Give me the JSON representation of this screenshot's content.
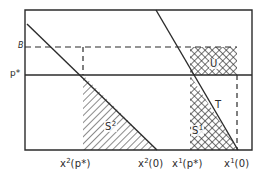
{
  "figure": {
    "type": "economics-diagram",
    "background_color": "#ffffff",
    "line_color": "#2b2b2b",
    "frame": {
      "x": 25,
      "y": 10,
      "width": 227,
      "height": 140
    },
    "axes": {
      "y_labels": [
        {
          "id": "B",
          "text": "B",
          "value_y": 47,
          "style": "italic"
        },
        {
          "id": "p_star",
          "text": "p*",
          "value_y": 75,
          "style": "normal"
        }
      ],
      "x_labels": [
        {
          "id": "x2_pstar",
          "base": "x",
          "sup": "2",
          "arg": "(p*)",
          "tick_x": 83
        },
        {
          "id": "x2_0",
          "base": "x",
          "sup": "2",
          "arg": "(0)",
          "tick_x": 155
        },
        {
          "id": "x1_pstar",
          "base": "x",
          "sup": "1",
          "arg": "(p*)",
          "tick_x": 190
        },
        {
          "id": "x1_0",
          "base": "x",
          "sup": "1",
          "arg": "(0)",
          "tick_x": 237
        }
      ]
    },
    "regions": [
      {
        "id": "S2",
        "base": "S",
        "sup": "2",
        "hatch": "diagonal",
        "label_x": 110,
        "label_y": 126
      },
      {
        "id": "S1",
        "base": "S",
        "sup": "1",
        "hatch": "cross",
        "label_x": 196,
        "label_y": 130
      },
      {
        "id": "T",
        "base": "T",
        "sup": "",
        "hatch": "none",
        "label_x": 218,
        "label_y": 105
      },
      {
        "id": "U",
        "base": "U",
        "sup": "",
        "hatch": "cross",
        "label_x": 212,
        "label_y": 64
      }
    ],
    "lines": {
      "demand_curve_2": {
        "from_x": 27,
        "from_y": 24,
        "to_x": 157,
        "to_y": 150
      },
      "demand_curve_1": {
        "from_x": 156,
        "from_y": 10,
        "to_x": 238,
        "to_y": 150
      },
      "p_star_line": {
        "y": 75
      },
      "B_line_dashed": {
        "y": 47
      },
      "x2_pstar_vertical_dashed": {
        "x": 83
      },
      "x1_0_vertical_dashed": {
        "x": 237
      }
    }
  }
}
